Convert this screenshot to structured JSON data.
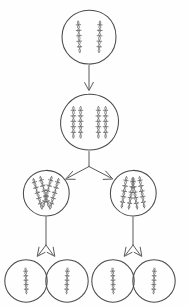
{
  "figure": {
    "kind": "hand-drawn biology diagram",
    "background_color": "#fefefe",
    "ink_color": "#4a4a4a",
    "chromatin_color": "#6b6b6b",
    "arrow_color": "#5a5a5a",
    "canvas": {
      "width": 188,
      "height": 307
    }
  },
  "stages": [
    {
      "id": "parent-cell",
      "label": "",
      "row": 1,
      "cell_count": 1,
      "chromosomes_per_cell": 2,
      "chromosome_style": "single-helix-strand",
      "center": {
        "x": 89,
        "y": 37
      },
      "radius": 27
    },
    {
      "id": "replicated-cell",
      "label": "",
      "row": 2,
      "cell_count": 1,
      "chromosomes_per_cell": 2,
      "chromatids_per_chromosome": 2,
      "chromosome_style": "duplicated-pair-helix",
      "center": {
        "x": 89,
        "y": 122
      },
      "radius": 28
    },
    {
      "id": "daughter-cell-left",
      "label": "",
      "row": 3,
      "cell_count": 1,
      "chromosomes_per_cell": 2,
      "chromosome_style": "crossed-x-helix",
      "center": {
        "x": 46,
        "y": 193
      },
      "radius": 23
    },
    {
      "id": "daughter-cell-right",
      "label": "",
      "row": 3,
      "cell_count": 1,
      "chromosomes_per_cell": 2,
      "chromosome_style": "crossed-x-helix",
      "center": {
        "x": 133,
        "y": 193
      },
      "radius": 23
    },
    {
      "id": "gamete-1",
      "label": "",
      "row": 4,
      "chromosomes_per_cell": 1,
      "chromosome_style": "single-helix-strand",
      "center": {
        "x": 26,
        "y": 281
      },
      "radius": 21
    },
    {
      "id": "gamete-2",
      "label": "",
      "row": 4,
      "chromosomes_per_cell": 1,
      "chromosome_style": "single-helix-strand",
      "center": {
        "x": 67,
        "y": 281
      },
      "radius": 21
    },
    {
      "id": "gamete-3",
      "label": "",
      "row": 4,
      "chromosomes_per_cell": 1,
      "chromosome_style": "single-helix-strand",
      "center": {
        "x": 113,
        "y": 281
      },
      "radius": 21
    },
    {
      "id": "gamete-4",
      "label": "",
      "row": 4,
      "chromosomes_per_cell": 1,
      "chromosome_style": "single-helix-strand",
      "center": {
        "x": 154,
        "y": 281
      },
      "radius": 21
    }
  ],
  "connectors": [
    {
      "id": "arrow-replication",
      "label": "",
      "type": "straight-down",
      "from": "parent-cell",
      "to": "replicated-cell"
    },
    {
      "id": "arrow-division-1",
      "label": "",
      "type": "branching-y",
      "from": "replicated-cell",
      "to": [
        "daughter-cell-left",
        "daughter-cell-right"
      ]
    },
    {
      "id": "arrow-division-2-left",
      "label": "",
      "type": "branching-y-short",
      "from": "daughter-cell-left",
      "to": [
        "gamete-1",
        "gamete-2"
      ]
    },
    {
      "id": "arrow-division-2-right",
      "label": "",
      "type": "branching-y-short",
      "from": "daughter-cell-right",
      "to": [
        "gamete-3",
        "gamete-4"
      ]
    }
  ]
}
